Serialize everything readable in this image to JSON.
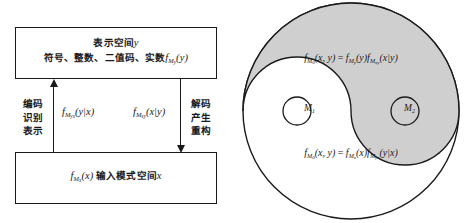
{
  "figure": {
    "left_panel": {
      "top_box": {
        "line1_cn": "表示空间",
        "line1_var": "y",
        "line2_cn": "符号、整数、二值码、实数",
        "line2_fn": "f",
        "line2_sub": "M",
        "line2_subsub": "y",
        "line2_arg": "(y)"
      },
      "bottom_box": {
        "fn": "f",
        "sub": "M",
        "subsub": "x",
        "arg": "(x)",
        "cn": "输入模式空间",
        "var": "x"
      },
      "left_label": "编码\n识别\n表示",
      "left_label_lines": [
        "编码",
        "识别",
        "表示"
      ],
      "right_label_lines": [
        "解码",
        "产生",
        "重构"
      ],
      "encode_formula": {
        "fn": "f",
        "sub": "M",
        "subsub": "yx",
        "arg": "(y|x)"
      },
      "decode_formula": {
        "fn": "f",
        "sub": "M",
        "subsub": "xy",
        "arg": "(x|y)"
      },
      "arrow_encode_direction": "up",
      "arrow_decode_direction": "down"
    },
    "right_panel": {
      "shape": "taiji",
      "top_formula": {
        "lhs_fn": "f",
        "lhs_sub": "M",
        "lhs_subsub": "0",
        "lhs_arg": "(x, y)",
        "eq": "=",
        "rhs1_fn": "f",
        "rhs1_sub": "M",
        "rhs1_subsub": "y",
        "rhs1_arg": "(y)",
        "rhs2_fn": "f",
        "rhs2_sub": "M",
        "rhs2_subsub": "xy",
        "rhs2_arg": "(x|y)"
      },
      "bottom_formula": {
        "lhs_fn": "f",
        "lhs_sub": "M",
        "lhs_subsub": "0",
        "lhs_arg": "(x, y)",
        "eq": "=",
        "rhs1_fn": "f",
        "rhs1_sub": "M",
        "rhs1_subsub": "x",
        "rhs1_arg": "(x)",
        "rhs2_fn": "f",
        "rhs2_sub": "M",
        "rhs2_subsub": "yx",
        "rhs2_arg": "(y|x)"
      },
      "node_left": {
        "label": "M",
        "sub": "1"
      },
      "node_right": {
        "label": "M",
        "sub": "2"
      }
    },
    "colors": {
      "stroke": "#1a1a1a",
      "fill_shaded": "#cfcfcf",
      "fill_plain": "#ffffff",
      "background": "#ffffff"
    }
  }
}
